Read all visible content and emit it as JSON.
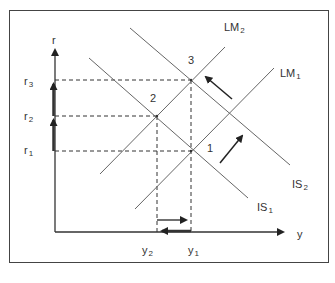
{
  "diagram": {
    "type": "IS-LM diagram",
    "axes": {
      "y_axis_label": "r",
      "x_axis_label": "y"
    },
    "r_levels": [
      {
        "base": "r",
        "sub": "3"
      },
      {
        "base": "r",
        "sub": "2"
      },
      {
        "base": "r",
        "sub": "1"
      }
    ],
    "y_levels": [
      {
        "base": "y",
        "sub": "2"
      },
      {
        "base": "y",
        "sub": "1"
      }
    ],
    "curves": {
      "lm2": {
        "base": "LM",
        "sub": "2"
      },
      "lm1": {
        "base": "LM",
        "sub": "1"
      },
      "is2": {
        "base": "IS",
        "sub": "2"
      },
      "is1": {
        "base": "IS",
        "sub": "1"
      }
    },
    "points": {
      "p1": "1",
      "p2": "2",
      "p3": "3"
    },
    "colors": {
      "line": "#555555",
      "axis": "#333333",
      "frame": "#444444",
      "text": "#333333"
    }
  }
}
